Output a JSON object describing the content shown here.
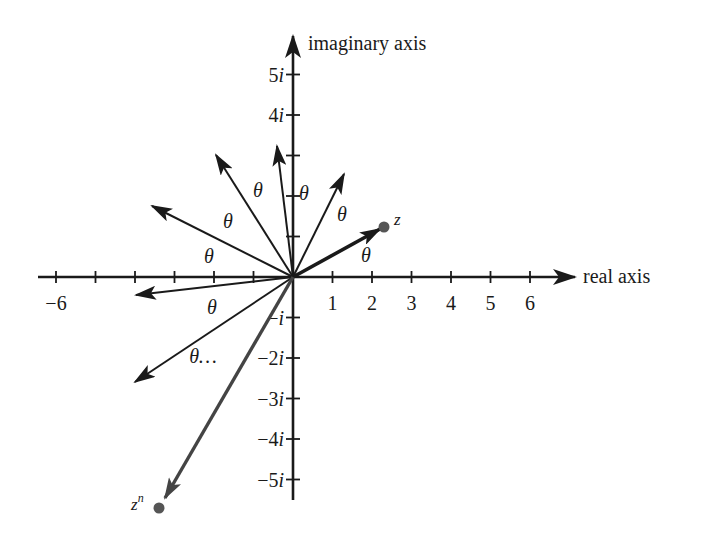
{
  "diagram": {
    "colors": {
      "ink": "#1a1a1a",
      "point": "#555555",
      "zn_vector": "#444444"
    },
    "axes": {
      "real_label": "real axis",
      "imaginary_label": "imaginary axis",
      "origin_px": [
        293,
        277
      ],
      "unit_px_x": 39.5,
      "unit_px_y": 40.5,
      "real_ticks": [
        -6,
        -5,
        -4,
        -3,
        -2,
        -1,
        1,
        2,
        3,
        4,
        5,
        6
      ],
      "real_tick_labels": [
        {
          "value": -6,
          "text": "−6"
        },
        {
          "value": 1,
          "text": "1"
        },
        {
          "value": 2,
          "text": "2"
        },
        {
          "value": 3,
          "text": "3"
        },
        {
          "value": 4,
          "text": "4"
        },
        {
          "value": 5,
          "text": "5"
        },
        {
          "value": 6,
          "text": "6"
        }
      ],
      "imag_ticks": [
        -5,
        -4,
        -3,
        -2,
        -1,
        1,
        2,
        3,
        4,
        5
      ],
      "imag_tick_labels": [
        {
          "value": 5,
          "text": "5i"
        },
        {
          "value": 4,
          "text": "4i"
        },
        {
          "value": -1,
          "text": "−i"
        },
        {
          "value": -2,
          "text": "−2i"
        },
        {
          "value": -3,
          "text": "−3i"
        },
        {
          "value": -4,
          "text": "−4i"
        },
        {
          "value": -5,
          "text": "−5i"
        }
      ]
    },
    "vectors": [
      {
        "name": "z",
        "tip_px": [
          380,
          229
        ],
        "bold": true
      },
      {
        "name": "z2",
        "tip_px": [
          344,
          174
        ]
      },
      {
        "name": "z3",
        "tip_px": [
          277,
          146
        ]
      },
      {
        "name": "z4",
        "tip_px": [
          216,
          155
        ]
      },
      {
        "name": "z5",
        "tip_px": [
          152,
          206
        ]
      },
      {
        "name": "z6",
        "tip_px": [
          136,
          295
        ]
      },
      {
        "name": "z7",
        "tip_px": [
          135,
          382
        ]
      },
      {
        "name": "zn",
        "tip_px": [
          165,
          498
        ],
        "gray": true
      }
    ],
    "points": [
      {
        "name": "z",
        "label": "z",
        "px": [
          384,
          227
        ]
      },
      {
        "name": "zn",
        "label_base": "z",
        "label_sup": "n",
        "px": [
          159,
          508
        ]
      }
    ],
    "angle_labels": [
      {
        "text": "θ",
        "px": [
          366,
          262
        ]
      },
      {
        "text": "θ",
        "px": [
          342,
          221
        ]
      },
      {
        "text": "θ",
        "px": [
          304,
          200
        ]
      },
      {
        "text": "θ",
        "px": [
          258,
          197
        ]
      },
      {
        "text": "θ",
        "px": [
          228,
          228
        ]
      },
      {
        "text": "θ",
        "px": [
          209,
          263
        ]
      },
      {
        "text": "θ",
        "px": [
          212,
          314
        ]
      },
      {
        "text": "θ…",
        "px": [
          203,
          363
        ],
        "upright": true
      }
    ]
  }
}
